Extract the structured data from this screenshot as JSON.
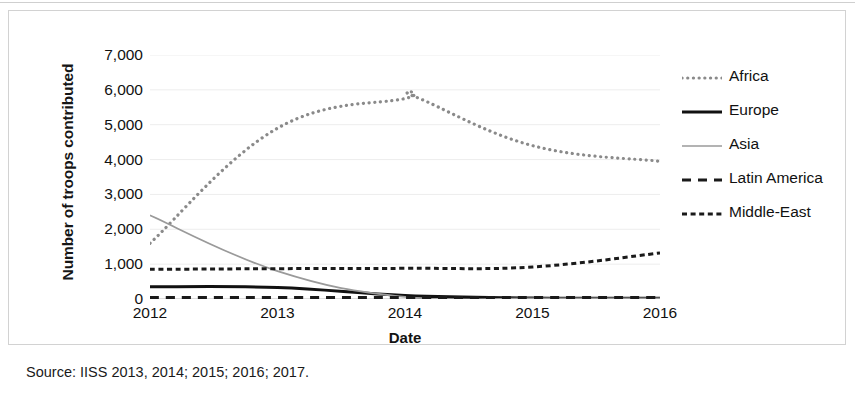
{
  "figure": {
    "source_caption": "Source: IISS 2013, 2014; 2015; 2016; 2017."
  },
  "chart_data": {
    "type": "line",
    "title": "",
    "xlabel": "Date",
    "ylabel": "Number of troops contributed",
    "x": [
      2012,
      2013,
      2014,
      2015,
      2016
    ],
    "xtick_labels": [
      "2012",
      "2013",
      "2014",
      "2015",
      "2016"
    ],
    "ytick_labels": [
      "0",
      "1,000",
      "2,000",
      "3,000",
      "4,000",
      "5,000",
      "6,000",
      "7,000"
    ],
    "yticks": [
      0,
      1000,
      2000,
      3000,
      4000,
      5000,
      6000,
      7000
    ],
    "ylim": [
      0,
      7000
    ],
    "xlim": [
      2012,
      2016
    ],
    "grid": true,
    "grid_axis": "y",
    "legend_position": "right",
    "series": [
      {
        "name": "Africa",
        "values": [
          1600,
          4900,
          5750,
          4400,
          3950
        ],
        "peak_value": 5800,
        "style": "dotted",
        "color": "#8a8a8a"
      },
      {
        "name": "Europe",
        "values": [
          350,
          330,
          100,
          30,
          20
        ],
        "style": "solid",
        "color": "#111111"
      },
      {
        "name": "Asia",
        "values": [
          2400,
          800,
          60,
          20,
          20
        ],
        "style": "solid-thin",
        "color": "#9a9a9a"
      },
      {
        "name": "Latin America",
        "values": [
          40,
          40,
          40,
          40,
          40
        ],
        "style": "dashed",
        "color": "#1a1a1a"
      },
      {
        "name": "Middle-East",
        "values": [
          850,
          870,
          880,
          920,
          1320
        ],
        "style": "fine-dashed",
        "color": "#1a1a1a"
      }
    ]
  },
  "legend": {
    "items": [
      {
        "label": "Africa"
      },
      {
        "label": "Europe"
      },
      {
        "label": "Asia"
      },
      {
        "label": "Latin America"
      },
      {
        "label": "Middle-East"
      }
    ]
  }
}
